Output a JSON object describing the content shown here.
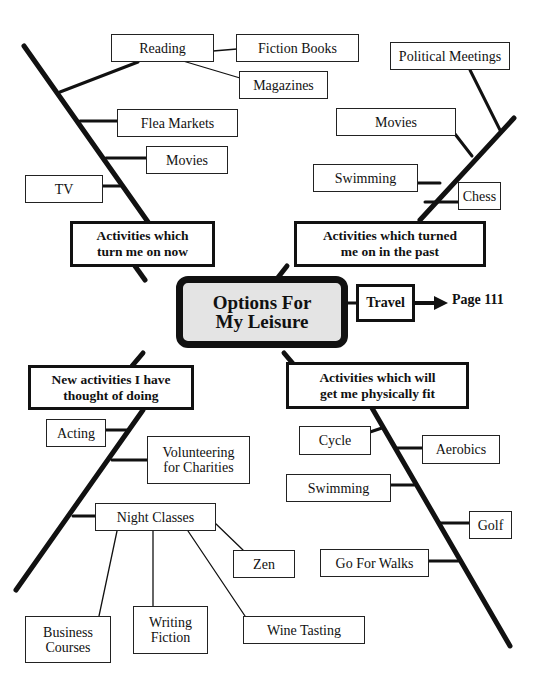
{
  "center": {
    "line1": "Options For",
    "line2": "My Leisure"
  },
  "travel": {
    "label": "Travel",
    "page_ref": "Page 111"
  },
  "categories": {
    "now": {
      "line1": "Activities which",
      "line2": "turn me on now"
    },
    "past": {
      "line1": "Activities which turned",
      "line2": "me on in the past"
    },
    "new": {
      "line1": "New activities I have",
      "line2": "thought of doing"
    },
    "fit": {
      "line1": "Activities which will",
      "line2": "get me physically fit"
    }
  },
  "now_items": {
    "reading": "Reading",
    "fiction_books": "Fiction Books",
    "magazines": "Magazines",
    "flea_markets": "Flea Markets",
    "movies": "Movies",
    "tv": "TV"
  },
  "past_items": {
    "political_meetings": "Political Meetings",
    "movies": "Movies",
    "swimming": "Swimming",
    "chess": "Chess"
  },
  "new_items": {
    "acting": "Acting",
    "volunteering_1": "Volunteering",
    "volunteering_2": "for Charities",
    "night_classes": "Night Classes",
    "zen": "Zen",
    "business_1": "Business",
    "business_2": "Courses",
    "writing_1": "Writing",
    "writing_2": "Fiction",
    "wine_tasting": "Wine Tasting"
  },
  "fit_items": {
    "cycle": "Cycle",
    "aerobics": "Aerobics",
    "swimming": "Swimming",
    "golf": "Golf",
    "go_for_walks": "Go For Walks"
  }
}
